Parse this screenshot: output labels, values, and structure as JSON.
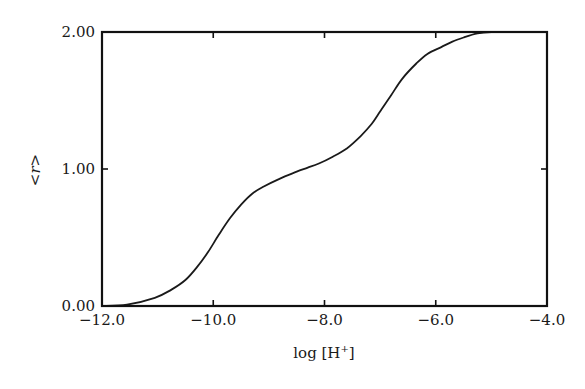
{
  "chart_data": {
    "type": "line",
    "title": "",
    "xlabel": "log [H+]",
    "xlabel_parts": {
      "base": "log [H",
      "sup": "+",
      "close": "]"
    },
    "ylabel": "<r>",
    "xlim": [
      -12.0,
      -4.0
    ],
    "ylim": [
      0.0,
      2.0
    ],
    "grid": false,
    "legend": null,
    "x_ticks": [
      -12.0,
      -10.0,
      -8.0,
      -6.0,
      -4.0
    ],
    "x_tick_labels": [
      "−12.0",
      "−10.0",
      "−8.0",
      "−6.0",
      "−4.0"
    ],
    "y_ticks": [
      0.0,
      1.0,
      2.0
    ],
    "y_tick_labels": [
      "0.00",
      "1.00",
      "2.00"
    ],
    "series": [
      {
        "name": "<r>",
        "color": "#1a1a1a",
        "x": [
          -12.0,
          -11.55,
          -11.05,
          -10.75,
          -10.5,
          -10.3,
          -10.1,
          -9.9,
          -9.7,
          -9.5,
          -9.3,
          -9.1,
          -8.8,
          -8.5,
          -8.3,
          -8.1,
          -7.85,
          -7.6,
          -7.35,
          -7.15,
          -7.0,
          -6.8,
          -6.6,
          -6.35,
          -6.15,
          -5.9,
          -5.7,
          -5.5,
          -5.25,
          -5.0,
          -4.7,
          -4.4
        ],
        "y": [
          0.0,
          0.01,
          0.06,
          0.12,
          0.19,
          0.28,
          0.39,
          0.52,
          0.64,
          0.74,
          0.82,
          0.87,
          0.93,
          0.98,
          1.01,
          1.04,
          1.09,
          1.15,
          1.24,
          1.33,
          1.42,
          1.54,
          1.66,
          1.77,
          1.84,
          1.89,
          1.93,
          1.96,
          1.99,
          2.0,
          2.0,
          2.0
        ]
      }
    ]
  }
}
